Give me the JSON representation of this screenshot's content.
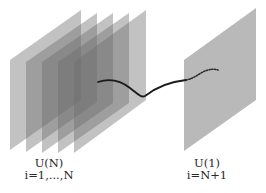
{
  "diagram": {
    "type": "brane-stack",
    "left_stack": {
      "plane_count": 5,
      "label_group": "U(N)",
      "label_index": "i=1,...,N",
      "fill": "#6e6e6e",
      "opacity": 0.42
    },
    "right_plane": {
      "label_group": "U(1)",
      "label_index": "i=N+1",
      "fill": "#b9b9b9"
    },
    "string": {
      "color": "#1a1a1a",
      "solid_segment": "from inside stack to right plane",
      "dotted_segment": "behind right plane"
    }
  }
}
